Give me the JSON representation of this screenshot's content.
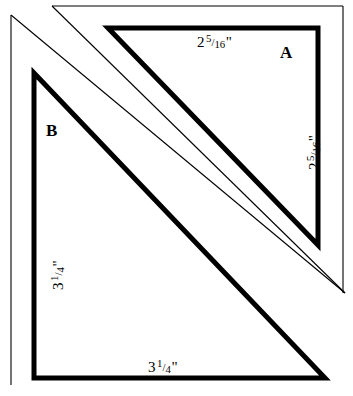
{
  "diagram": {
    "type": "quilting-cutting-template",
    "background_color": "#ffffff",
    "line_color": "#000000",
    "thin_stroke_width": 1,
    "thick_stroke_width": 5,
    "pieces": [
      {
        "id": "A",
        "label": "A",
        "shape": "right-triangle",
        "dimensions": [
          {
            "side": "top",
            "whole": "2",
            "numerator": "5",
            "denominator": "16",
            "unit": "\"",
            "text": "2 5/16\""
          },
          {
            "side": "right",
            "whole": "2",
            "numerator": "5",
            "denominator": "16",
            "unit": "\"",
            "text": "2 5/16\""
          }
        ]
      },
      {
        "id": "B",
        "label": "B",
        "shape": "right-triangle",
        "dimensions": [
          {
            "side": "left",
            "whole": "3",
            "numerator": "1",
            "denominator": "4",
            "unit": "\"",
            "text": "3 1/4\""
          },
          {
            "side": "bottom",
            "whole": "3",
            "numerator": "1",
            "denominator": "4",
            "unit": "\"",
            "text": "3 1/4\""
          }
        ]
      }
    ]
  },
  "labels": {
    "piece_a": "A",
    "piece_b": "B",
    "a_top": {
      "whole": "2",
      "num": "5",
      "sol": "/",
      "den": "16",
      "inch": "\""
    },
    "a_right": {
      "whole": "2",
      "num": "5",
      "sol": "/",
      "den": "16",
      "inch": "\""
    },
    "b_left": {
      "whole": "3",
      "num": "1",
      "sol": "/",
      "den": "4",
      "inch": "\""
    },
    "b_bottom": {
      "whole": "3",
      "num": "1",
      "sol": "/",
      "den": "4",
      "inch": "\""
    }
  },
  "geometry": {
    "thin_outline_b": "M 11,15 L 11,385",
    "thin_outline_b_hyp": "M 11,15 L 345,293",
    "thin_outline_a": "M 52,6 L 343,6 L 343,293",
    "thin_mid_diagonal": "M 52,6 L 345,293",
    "triangle_a": "M 108,28 L 318,28 L 318,245 Z",
    "triangle_b": "M 34,73 L 34,378 L 325,378 Z"
  }
}
